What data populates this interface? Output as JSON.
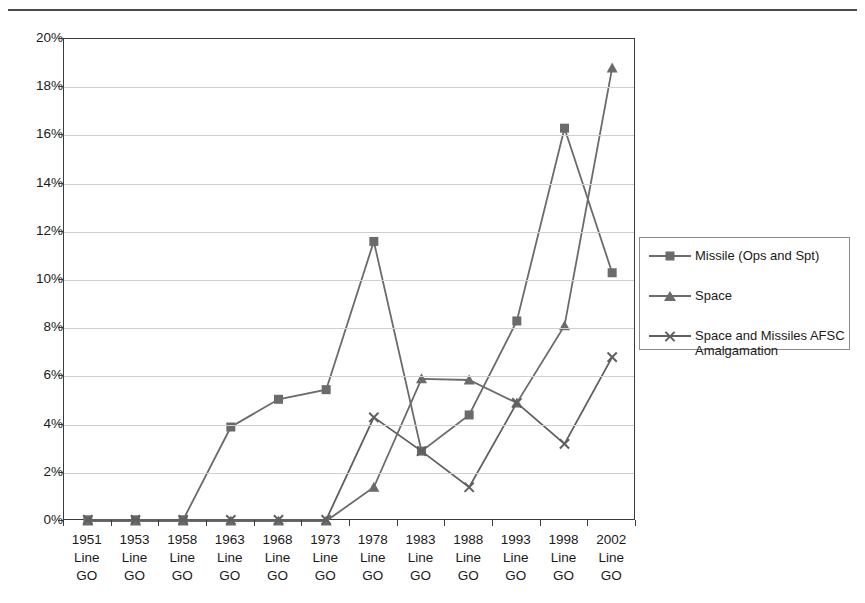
{
  "figure": {
    "top_rule": "horizontal-rule",
    "background": "#ffffff"
  },
  "axes": {
    "y_ticks": [
      "0%",
      "2%",
      "4%",
      "6%",
      "8%",
      "10%",
      "12%",
      "14%",
      "16%",
      "18%",
      "20%"
    ],
    "y_values": [
      0,
      2,
      4,
      6,
      8,
      10,
      12,
      14,
      16,
      18,
      20
    ],
    "y_min": 0,
    "y_max": 20,
    "x_label_line2": "Line",
    "x_label_line3": "GO"
  },
  "legend": {
    "position": "right",
    "entries": [
      {
        "label": "Missile (Ops and Spt)",
        "marker": "square",
        "color": "#6b6b6b"
      },
      {
        "label": "Space",
        "marker": "triangle",
        "color": "#6b6b6b"
      },
      {
        "label": "Space and Missiles AFSC Amalgamation",
        "marker": "x",
        "color": "#5f5f5f"
      }
    ]
  },
  "chart_data": {
    "type": "line",
    "title": "",
    "xlabel": "",
    "ylabel": "",
    "ylim": [
      0,
      20
    ],
    "grid": true,
    "legend_position": "right",
    "categories": [
      "1951 Line GO",
      "1953 Line GO",
      "1958 Line GO",
      "1963 Line GO",
      "1968 Line GO",
      "1973 Line GO",
      "1978 Line GO",
      "1983 Line GO",
      "1988 Line GO",
      "1993 Line GO",
      "1998 Line GO",
      "2002 Line GO"
    ],
    "category_years": [
      "1951",
      "1953",
      "1958",
      "1963",
      "1968",
      "1973",
      "1978",
      "1983",
      "1988",
      "1993",
      "1998",
      "2002"
    ],
    "series": [
      {
        "name": "Missile (Ops and Spt)",
        "marker": "square",
        "color": "#6b6b6b",
        "values": [
          0.05,
          0.05,
          0.05,
          3.9,
          5.05,
          5.45,
          11.6,
          2.9,
          4.4,
          8.3,
          16.3,
          10.3
        ]
      },
      {
        "name": "Space",
        "marker": "triangle",
        "color": "#6b6b6b",
        "values": [
          0,
          0,
          0,
          0,
          0,
          0,
          1.4,
          5.9,
          5.85,
          4.9,
          8.1,
          18.8
        ]
      },
      {
        "name": "Space and Missiles AFSC Amalgamation",
        "marker": "x",
        "color": "#5f5f5f",
        "values": [
          0.05,
          0.05,
          0.05,
          0.05,
          0.05,
          0.05,
          4.3,
          2.9,
          1.4,
          4.9,
          3.2,
          6.8
        ]
      }
    ]
  }
}
